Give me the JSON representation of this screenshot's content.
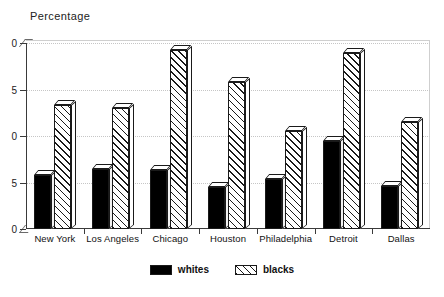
{
  "chart_data": {
    "type": "bar",
    "title": "Percentage",
    "xlabel": "",
    "ylabel": "Percentage",
    "ylim": [
      0,
      20
    ],
    "yticks": [
      0,
      5,
      10,
      15,
      20
    ],
    "ytick_labels": [
      "0",
      "5",
      "0",
      "5",
      "0"
    ],
    "grid": true,
    "legend_position": "bottom-center",
    "categories": [
      "New York",
      "Los Angeles",
      "Chicago",
      "Houston",
      "Philadelphia",
      "Detroit",
      "Dallas"
    ],
    "series": [
      {
        "name": "whites",
        "fill": "solid-black",
        "color": "#000000",
        "values": [
          5.8,
          6.5,
          6.3,
          4.5,
          5.4,
          9.5,
          4.6
        ]
      },
      {
        "name": "blacks",
        "fill": "diagonal-hatch",
        "color": "#ffffff",
        "values": [
          13.3,
          13.0,
          19.2,
          15.8,
          10.5,
          18.9,
          11.5
        ]
      }
    ]
  },
  "legend": {
    "items": [
      {
        "label": "whites",
        "style": "whites"
      },
      {
        "label": "blacks",
        "style": "blacks"
      }
    ]
  },
  "colors": {
    "axis": "#3a3a3a",
    "grid": "#c6c6c6",
    "text": "#1a1a1a",
    "background": "#ffffff"
  }
}
